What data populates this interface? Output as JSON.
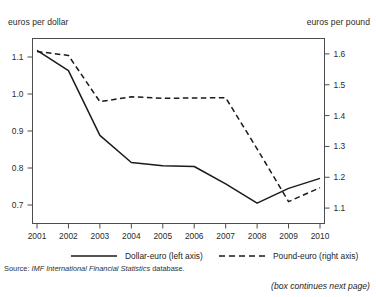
{
  "page": {
    "clipped_top_text": "",
    "source_prefix": "Source:",
    "source_italic": "IMF International Financial Statistics",
    "source_suffix": "database.",
    "continues_note": "(box continues next page)"
  },
  "chart_data": {
    "type": "line",
    "title": "",
    "xlabel": "",
    "ylabel": "euros per dollar",
    "y2label": "euros per pound",
    "grid": false,
    "legend_position": "bottom",
    "x": [
      2001,
      2002,
      2003,
      2004,
      2005,
      2006,
      2007,
      2008,
      2009,
      2010
    ],
    "categories": [
      "2001",
      "2002",
      "2003",
      "2004",
      "2005",
      "2006",
      "2007",
      "2008",
      "2009",
      "2010"
    ],
    "ylim": [
      0.65,
      1.15
    ],
    "yticks": [
      0.7,
      0.8,
      0.9,
      1.0,
      1.1
    ],
    "ytick_labels": [
      "0.7",
      "0.8",
      "0.9",
      "1.0",
      "1.1"
    ],
    "y2lim": [
      1.05,
      1.65
    ],
    "y2ticks": [
      1.1,
      1.2,
      1.3,
      1.4,
      1.5,
      1.6
    ],
    "y2tick_labels": [
      "1.1",
      "1.2",
      "1.3",
      "1.4",
      "1.5",
      "1.6"
    ],
    "series": [
      {
        "name": "Dollar-euro (left axis)",
        "axis": "left",
        "style": "solid",
        "color": "#1a1a1a",
        "values": [
          1.118,
          1.063,
          0.888,
          0.815,
          0.806,
          0.804,
          0.757,
          0.705,
          0.745,
          0.772
        ]
      },
      {
        "name": "Pound-euro (right axis)",
        "axis": "right",
        "style": "dashed",
        "color": "#1a1a1a",
        "values": [
          1.608,
          1.595,
          1.445,
          1.461,
          1.456,
          1.457,
          1.458,
          1.292,
          1.121,
          1.166
        ]
      }
    ],
    "legend": [
      {
        "label": "Dollar-euro (left axis)",
        "style": "solid"
      },
      {
        "label": "Pound-euro (right axis)",
        "style": "dashed"
      }
    ]
  }
}
